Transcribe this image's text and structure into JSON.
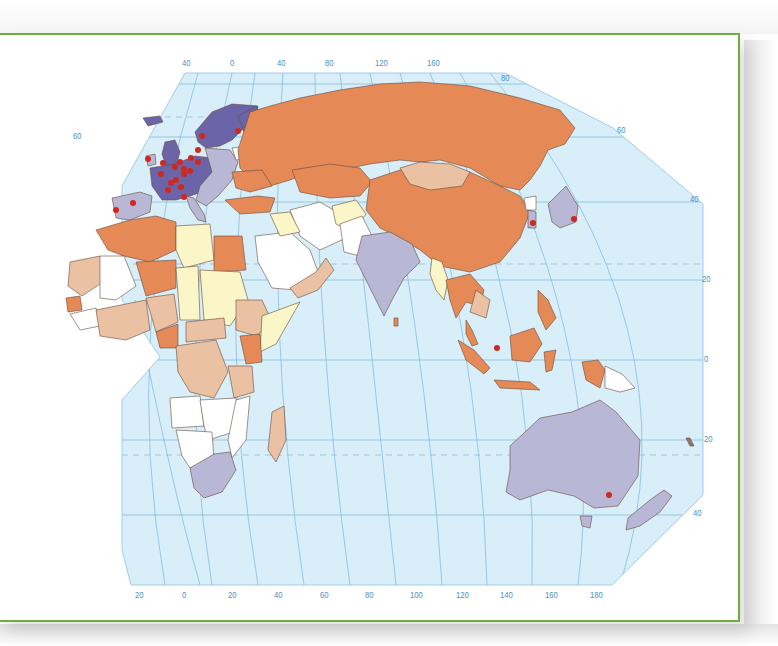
{
  "map": {
    "projection_labels": {
      "top_longitudes": [
        {
          "text": "40",
          "x": 182,
          "y": 58
        },
        {
          "text": "0",
          "x": 230,
          "y": 58
        },
        {
          "text": "40",
          "x": 277,
          "y": 58
        },
        {
          "text": "80",
          "x": 325,
          "y": 58
        },
        {
          "text": "120",
          "x": 375,
          "y": 58
        },
        {
          "text": "160",
          "x": 427,
          "y": 58
        }
      ],
      "top_right_latitudes": [
        {
          "text": "80",
          "x": 501,
          "y": 73
        },
        {
          "text": "60",
          "x": 617,
          "y": 125
        }
      ],
      "left_latitudes": [
        {
          "text": "60",
          "x": 73,
          "y": 131
        }
      ],
      "right_latitudes": [
        {
          "text": "40",
          "x": 690,
          "y": 194
        },
        {
          "text": "20",
          "x": 702,
          "y": 274
        },
        {
          "text": "0",
          "x": 704,
          "y": 354
        },
        {
          "text": "20",
          "x": 704,
          "y": 434
        },
        {
          "text": "40",
          "x": 693,
          "y": 508
        }
      ],
      "bottom_longitudes": [
        {
          "text": "20",
          "x": 135,
          "y": 590
        },
        {
          "text": "0",
          "x": 182,
          "y": 590
        },
        {
          "text": "20",
          "x": 228,
          "y": 590
        },
        {
          "text": "40",
          "x": 274,
          "y": 590
        },
        {
          "text": "60",
          "x": 320,
          "y": 590
        },
        {
          "text": "80",
          "x": 365,
          "y": 590
        },
        {
          "text": "100",
          "x": 410,
          "y": 590
        },
        {
          "text": "120",
          "x": 456,
          "y": 590
        },
        {
          "text": "140",
          "x": 500,
          "y": 590
        },
        {
          "text": "160",
          "x": 545,
          "y": 590
        },
        {
          "text": "180",
          "x": 590,
          "y": 590
        }
      ]
    },
    "colors": {
      "frame": "#6fae3c",
      "ocean": "#d8eef9",
      "graticule": "#7fb6dc",
      "category_dark_purple": "#6b64a8",
      "category_lavender": "#b9b7d6",
      "category_orange": "#e58a56",
      "category_tan": "#ebc1a3",
      "category_pale_yellow": "#fbf6c8",
      "category_white": "#ffffff",
      "marker": "#d0281e",
      "border": "#5a3a2a"
    },
    "markers_count": 30
  }
}
